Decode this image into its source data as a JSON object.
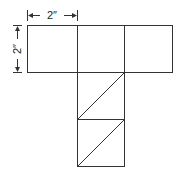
{
  "diagram": {
    "type": "cube-net",
    "dimension_labels": {
      "width": "2″",
      "height": "2″"
    },
    "stroke_color": "#333333",
    "background": "#ffffff",
    "squares": [
      {
        "x": 27,
        "y": 25,
        "size": 48
      },
      {
        "x": 77,
        "y": 25,
        "size": 48
      },
      {
        "x": 125,
        "y": 25,
        "size": 48
      },
      {
        "x": 77,
        "y": 72,
        "size": 48,
        "diagonal": true
      },
      {
        "x": 77,
        "y": 120,
        "size": 48,
        "diagonal": true
      }
    ]
  }
}
